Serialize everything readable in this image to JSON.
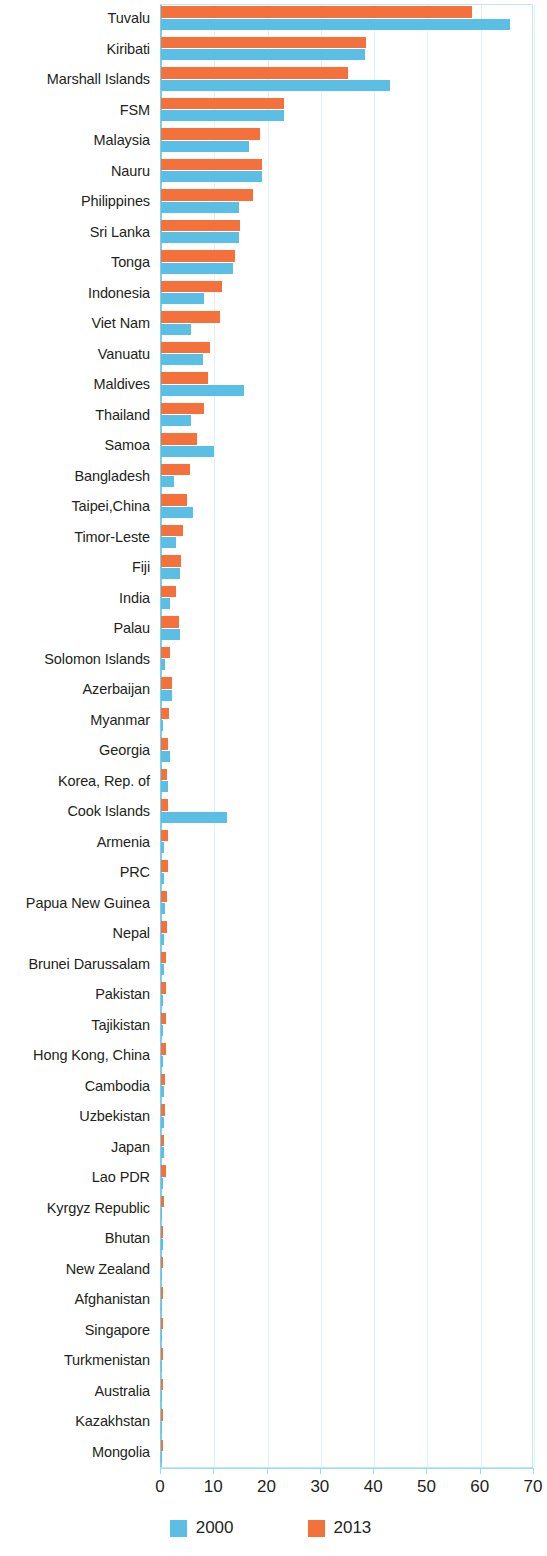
{
  "chart_data": {
    "type": "bar",
    "orientation": "horizontal",
    "title": "",
    "subtitle": "",
    "xlabel": "",
    "ylabel": "",
    "xlim": [
      0,
      70
    ],
    "xticks": [
      0,
      10,
      20,
      30,
      40,
      50,
      60,
      70
    ],
    "grid": true,
    "legend_position": "bottom",
    "colors": {
      "2000": "#5bbee5",
      "2013": "#f4713c"
    },
    "categories": [
      "Tuvalu",
      "Kiribati",
      "Marshall Islands",
      "FSM",
      "Malaysia",
      "Nauru",
      "Philippines",
      "Sri Lanka",
      "Tonga",
      "Indonesia",
      "Viet Nam",
      "Vanuatu",
      "Maldives",
      "Thailand",
      "Samoa",
      "Bangladesh",
      "Taipei,China",
      "Timor-Leste",
      "Fiji",
      "India",
      "Palau",
      "Solomon Islands",
      "Azerbaijan",
      "Myanmar",
      "Georgia",
      "Korea, Rep. of",
      "Cook Islands",
      "Armenia",
      "PRC",
      "Papua New Guinea",
      "Nepal",
      "Brunei Darussalam",
      "Pakistan",
      "Tajikistan",
      "Hong Kong, China",
      "Cambodia",
      "Uzbekistan",
      "Japan",
      "Lao PDR",
      "Kyrgyz Republic",
      "Bhutan",
      "New Zealand",
      "Afghanistan",
      "Singapore",
      "Turkmenistan",
      "Australia",
      "Kazakhstan",
      "Mongolia"
    ],
    "series": [
      {
        "name": "2000",
        "color": "#5bbee5",
        "values": [
          65.5,
          38.2,
          43.0,
          23.1,
          16.5,
          18.9,
          14.6,
          14.6,
          13.5,
          8.0,
          5.6,
          7.8,
          15.5,
          5.6,
          10.0,
          2.5,
          6.0,
          2.9,
          3.6,
          1.7,
          3.5,
          0.7,
          2.1,
          0.4,
          1.7,
          1.3,
          12.4,
          0.6,
          0.6,
          0.7,
          0.5,
          0.5,
          0.4,
          0.4,
          0.4,
          0.5,
          0.5,
          0.6,
          0.3,
          0.2,
          0.3,
          0.2,
          0.1,
          0.2,
          0.1,
          0.2,
          0.2,
          0.2
        ]
      },
      {
        "name": "2013",
        "color": "#f4713c",
        "values": [
          58.3,
          38.4,
          35.0,
          23.1,
          18.6,
          19.0,
          17.3,
          14.9,
          13.9,
          11.4,
          11.0,
          9.2,
          8.9,
          8.0,
          6.8,
          5.4,
          4.9,
          4.1,
          3.8,
          2.9,
          3.3,
          1.7,
          2.0,
          1.5,
          1.4,
          1.2,
          1.3,
          1.3,
          1.3,
          1.2,
          1.1,
          1.0,
          1.0,
          1.0,
          0.9,
          0.8,
          0.8,
          0.6,
          0.9,
          0.5,
          0.4,
          0.3,
          0.4,
          0.3,
          0.3,
          0.3,
          0.4,
          0.3
        ]
      }
    ]
  },
  "legend": {
    "items": [
      {
        "label": "2000",
        "color": "#5bbee5"
      },
      {
        "label": "2013",
        "color": "#f4713c"
      }
    ]
  },
  "axis": {
    "ticks": [
      "0",
      "10",
      "20",
      "30",
      "40",
      "50",
      "60",
      "70"
    ]
  }
}
